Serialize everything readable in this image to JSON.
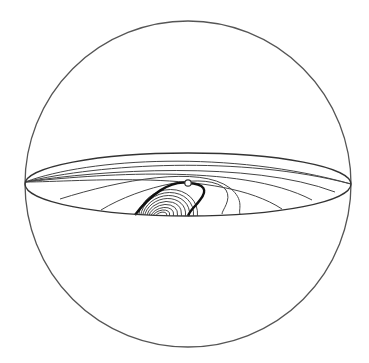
{
  "figure": {
    "type": "sphere-diagram",
    "sphere": {
      "cx": 188,
      "cy": 184,
      "r": 163,
      "stroke": "#555555",
      "stroke_width": 1.3
    },
    "equator": {
      "cx": 188,
      "cy": 184,
      "rx": 163,
      "ry_top": 31,
      "ry_bottom": 32,
      "stroke": "#333333",
      "stroke_width": 1.3
    },
    "marker": {
      "cx": 188,
      "cy": 183,
      "r": 3.2,
      "fill": "#ffffff",
      "stroke": "#333333"
    },
    "colors": {
      "line": "#444444",
      "separatrix": "#111111",
      "background": "#ffffff"
    },
    "flow_lines": [
      "M 25 182 C 90 158, 230 150, 351 184",
      "M 25 182 C 100 164, 240 155, 351 184",
      "M 25 182 C 100 170, 250 160, 335 192",
      "M 25 182 C 90 175, 240 162, 312 200",
      "M 25 182 C 80 182, 220 168, 282 209",
      "M 60 199 C 120 180, 200 165, 230 188 C 245 200, 238 210, 240 214",
      "M 101 210 C 140 186, 210 170, 226 190 C 232 200, 222 210, 222 214"
    ],
    "separatrix": "M 135 215 C 150 195, 170 180, 188 183 C 205 184, 208 190, 200 200 C 195 207, 190 210, 188 216",
    "inner_contours": [
      {
        "cx": 168,
        "cy": 216,
        "rx": 30,
        "ry": 26,
        "rot": -20
      },
      {
        "cx": 167,
        "cy": 216,
        "rx": 27,
        "ry": 23,
        "rot": -20
      },
      {
        "cx": 166,
        "cy": 216,
        "rx": 24,
        "ry": 20,
        "rot": -20
      },
      {
        "cx": 165,
        "cy": 216,
        "rx": 21,
        "ry": 17,
        "rot": -20
      },
      {
        "cx": 164,
        "cy": 216,
        "rx": 18,
        "ry": 14,
        "rot": -20
      },
      {
        "cx": 163,
        "cy": 216,
        "rx": 15,
        "ry": 11,
        "rot": -20
      },
      {
        "cx": 162,
        "cy": 216,
        "rx": 12,
        "ry": 8,
        "rot": -20
      },
      {
        "cx": 161,
        "cy": 216,
        "rx": 9,
        "ry": 5.5,
        "rot": -20
      },
      {
        "cx": 161,
        "cy": 216,
        "rx": 6,
        "ry": 3.5,
        "rot": -20
      }
    ]
  }
}
